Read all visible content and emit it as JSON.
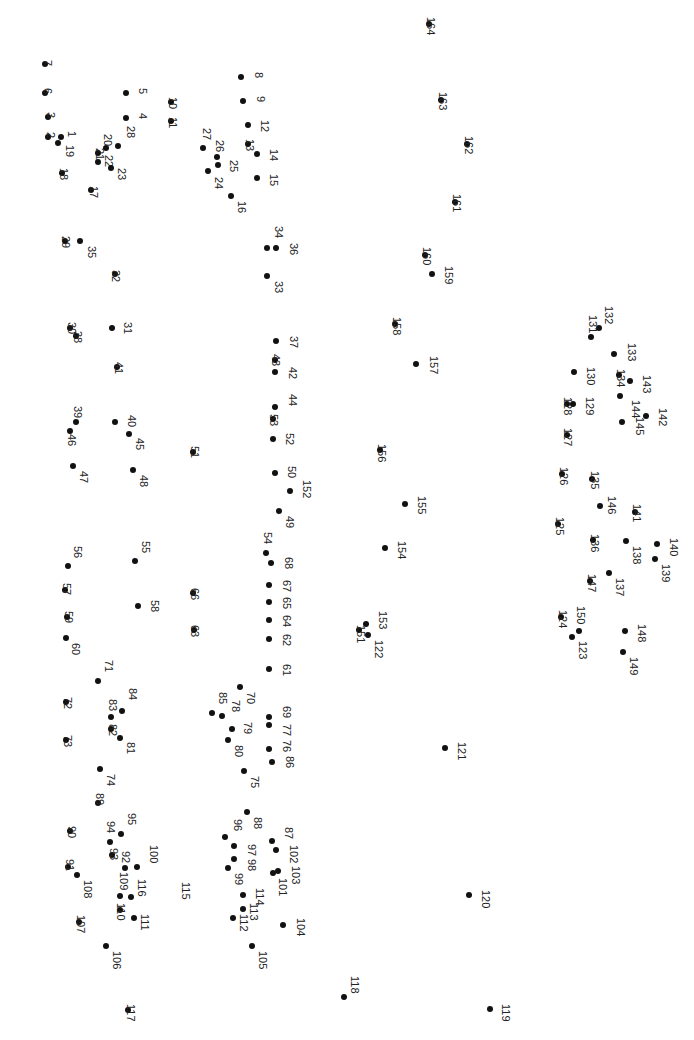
{
  "puzzle": {
    "type": "connect-the-dots",
    "orientation": "rotated-90",
    "dot_color": "#111111",
    "label_color": "#222222",
    "dots": [
      {
        "n": "1",
        "x": 61,
        "y": 137,
        "lx": 66,
        "ly": 131
      },
      {
        "n": "2",
        "x": 48,
        "y": 137,
        "lx": 45,
        "ly": 132
      },
      {
        "n": "3",
        "x": 48,
        "y": 117,
        "lx": 45,
        "ly": 112
      },
      {
        "n": "4",
        "x": 126,
        "y": 118,
        "lx": 137,
        "ly": 113
      },
      {
        "n": "5",
        "x": 126,
        "y": 93,
        "lx": 137,
        "ly": 88
      },
      {
        "n": "6",
        "x": 45,
        "y": 93,
        "lx": 42,
        "ly": 88
      },
      {
        "n": "7",
        "x": 45,
        "y": 64,
        "lx": 42,
        "ly": 60
      },
      {
        "n": "8",
        "x": 241,
        "y": 77,
        "lx": 253,
        "ly": 72
      },
      {
        "n": "9",
        "x": 243,
        "y": 101,
        "lx": 255,
        "ly": 96
      },
      {
        "n": "10",
        "x": 171,
        "y": 102,
        "lx": 167,
        "ly": 97
      },
      {
        "n": "11",
        "x": 171,
        "y": 121,
        "lx": 167,
        "ly": 117
      },
      {
        "n": "12",
        "x": 248,
        "y": 125,
        "lx": 259,
        "ly": 120
      },
      {
        "n": "13",
        "x": 248,
        "y": 144,
        "lx": 244,
        "ly": 139
      },
      {
        "n": "14",
        "x": 257,
        "y": 154,
        "lx": 268,
        "ly": 149
      },
      {
        "n": "15",
        "x": 257,
        "y": 178,
        "lx": 268,
        "ly": 174
      },
      {
        "n": "16",
        "x": 231,
        "y": 196,
        "lx": 236,
        "ly": 201
      },
      {
        "n": "17",
        "x": 91,
        "y": 190,
        "lx": 88,
        "ly": 186
      },
      {
        "n": "18",
        "x": 62,
        "y": 173,
        "lx": 58,
        "ly": 168
      },
      {
        "n": "19",
        "x": 58,
        "y": 143,
        "lx": 64,
        "ly": 145
      },
      {
        "n": "20",
        "x": 106,
        "y": 148,
        "lx": 102,
        "ly": 134
      },
      {
        "n": "21",
        "x": 98,
        "y": 153,
        "lx": 94,
        "ly": 148
      },
      {
        "n": "22",
        "x": 98,
        "y": 162,
        "lx": 103,
        "ly": 155
      },
      {
        "n": "23",
        "x": 111,
        "y": 168,
        "lx": 116,
        "ly": 168
      },
      {
        "n": "24",
        "x": 208,
        "y": 171,
        "lx": 213,
        "ly": 177
      },
      {
        "n": "25",
        "x": 218,
        "y": 165,
        "lx": 228,
        "ly": 160
      },
      {
        "n": "26",
        "x": 217,
        "y": 157,
        "lx": 214,
        "ly": 140
      },
      {
        "n": "27",
        "x": 203,
        "y": 148,
        "lx": 201,
        "ly": 128
      },
      {
        "n": "28",
        "x": 118,
        "y": 146,
        "lx": 125,
        "ly": 126
      },
      {
        "n": "29",
        "x": 65,
        "y": 241,
        "lx": 60,
        "ly": 236
      },
      {
        "n": "30",
        "x": 70,
        "y": 328,
        "lx": 66,
        "ly": 322
      },
      {
        "n": "31",
        "x": 112,
        "y": 328,
        "lx": 122,
        "ly": 322
      },
      {
        "n": "32",
        "x": 115,
        "y": 274,
        "lx": 110,
        "ly": 270
      },
      {
        "n": "33",
        "x": 267,
        "y": 276,
        "lx": 273,
        "ly": 281
      },
      {
        "n": "34",
        "x": 267,
        "y": 248,
        "lx": 273,
        "ly": 226
      },
      {
        "n": "35",
        "x": 80,
        "y": 241,
        "lx": 86,
        "ly": 246
      },
      {
        "n": "36",
        "x": 276,
        "y": 248,
        "lx": 288,
        "ly": 243
      },
      {
        "n": "37",
        "x": 276,
        "y": 341,
        "lx": 288,
        "ly": 336
      },
      {
        "n": "38",
        "x": 76,
        "y": 336,
        "lx": 72,
        "ly": 331
      },
      {
        "n": "39",
        "x": 76,
        "y": 422,
        "lx": 72,
        "ly": 406
      },
      {
        "n": "40",
        "x": 115,
        "y": 422,
        "lx": 126,
        "ly": 415
      },
      {
        "n": "41",
        "x": 117,
        "y": 367,
        "lx": 113,
        "ly": 362
      },
      {
        "n": "42",
        "x": 275,
        "y": 372,
        "lx": 287,
        "ly": 367
      },
      {
        "n": "43",
        "x": 275,
        "y": 360,
        "lx": 270,
        "ly": 354
      },
      {
        "n": "44",
        "x": 275,
        "y": 407,
        "lx": 287,
        "ly": 394
      },
      {
        "n": "45",
        "x": 129,
        "y": 434,
        "lx": 134,
        "ly": 438
      },
      {
        "n": "46",
        "x": 70,
        "y": 431,
        "lx": 66,
        "ly": 434
      },
      {
        "n": "47",
        "x": 73,
        "y": 466,
        "lx": 78,
        "ly": 471
      },
      {
        "n": "48",
        "x": 133,
        "y": 470,
        "lx": 138,
        "ly": 475
      },
      {
        "n": "49",
        "x": 279,
        "y": 511,
        "lx": 284,
        "ly": 516
      },
      {
        "n": "50",
        "x": 275,
        "y": 473,
        "lx": 286,
        "ly": 466
      },
      {
        "n": "51",
        "x": 193,
        "y": 452,
        "lx": 189,
        "ly": 446
      },
      {
        "n": "52",
        "x": 273,
        "y": 439,
        "lx": 284,
        "ly": 433
      },
      {
        "n": "53",
        "x": 273,
        "y": 419,
        "lx": 268,
        "ly": 414
      },
      {
        "n": "54",
        "x": 266,
        "y": 553,
        "lx": 262,
        "ly": 532
      },
      {
        "n": "55",
        "x": 135,
        "y": 561,
        "lx": 140,
        "ly": 541
      },
      {
        "n": "56",
        "x": 68,
        "y": 566,
        "lx": 72,
        "ly": 546
      },
      {
        "n": "57",
        "x": 65,
        "y": 590,
        "lx": 61,
        "ly": 583
      },
      {
        "n": "58",
        "x": 138,
        "y": 606,
        "lx": 149,
        "ly": 600
      },
      {
        "n": "59",
        "x": 67,
        "y": 617,
        "lx": 63,
        "ly": 611
      },
      {
        "n": "60",
        "x": 66,
        "y": 638,
        "lx": 70,
        "ly": 643
      },
      {
        "n": "61",
        "x": 269,
        "y": 669,
        "lx": 281,
        "ly": 664
      },
      {
        "n": "62",
        "x": 269,
        "y": 639,
        "lx": 281,
        "ly": 634
      },
      {
        "n": "63",
        "x": 194,
        "y": 630,
        "lx": 189,
        "ly": 625
      },
      {
        "n": "64",
        "x": 269,
        "y": 620,
        "lx": 281,
        "ly": 615
      },
      {
        "n": "65",
        "x": 269,
        "y": 602,
        "lx": 281,
        "ly": 597
      },
      {
        "n": "66",
        "x": 193,
        "y": 593,
        "lx": 189,
        "ly": 588
      },
      {
        "n": "67",
        "x": 269,
        "y": 585,
        "lx": 281,
        "ly": 580
      },
      {
        "n": "68",
        "x": 271,
        "y": 563,
        "lx": 283,
        "ly": 557
      },
      {
        "n": "69",
        "x": 269,
        "y": 717,
        "lx": 281,
        "ly": 706
      },
      {
        "n": "70",
        "x": 240,
        "y": 687,
        "lx": 245,
        "ly": 692
      },
      {
        "n": "71",
        "x": 98,
        "y": 681,
        "lx": 103,
        "ly": 660
      },
      {
        "n": "72",
        "x": 66,
        "y": 702,
        "lx": 62,
        "ly": 697
      },
      {
        "n": "73",
        "x": 66,
        "y": 740,
        "lx": 62,
        "ly": 735
      },
      {
        "n": "74",
        "x": 100,
        "y": 769,
        "lx": 105,
        "ly": 774
      },
      {
        "n": "75",
        "x": 244,
        "y": 771,
        "lx": 249,
        "ly": 776
      },
      {
        "n": "76",
        "x": 269,
        "y": 749,
        "lx": 281,
        "ly": 740
      },
      {
        "n": "77",
        "x": 269,
        "y": 725,
        "lx": 281,
        "ly": 724
      },
      {
        "n": "78",
        "x": 222,
        "y": 716,
        "lx": 230,
        "ly": 700
      },
      {
        "n": "79",
        "x": 232,
        "y": 729,
        "lx": 242,
        "ly": 722
      },
      {
        "n": "80",
        "x": 228,
        "y": 740,
        "lx": 233,
        "ly": 745
      },
      {
        "n": "81",
        "x": 120,
        "y": 738,
        "lx": 125,
        "ly": 742
      },
      {
        "n": "82",
        "x": 111,
        "y": 729,
        "lx": 107,
        "ly": 724
      },
      {
        "n": "83",
        "x": 111,
        "y": 717,
        "lx": 107,
        "ly": 699
      },
      {
        "n": "84",
        "x": 122,
        "y": 711,
        "lx": 127,
        "ly": 688
      },
      {
        "n": "85",
        "x": 212,
        "y": 713,
        "lx": 217,
        "ly": 692
      },
      {
        "n": "86",
        "x": 272,
        "y": 762,
        "lx": 284,
        "ly": 756
      },
      {
        "n": "87",
        "x": 272,
        "y": 841,
        "lx": 283,
        "ly": 827
      },
      {
        "n": "88",
        "x": 247,
        "y": 812,
        "lx": 252,
        "ly": 817
      },
      {
        "n": "89",
        "x": 98,
        "y": 803,
        "lx": 94,
        "ly": 793
      },
      {
        "n": "90",
        "x": 70,
        "y": 831,
        "lx": 66,
        "ly": 826
      },
      {
        "n": "91",
        "x": 68,
        "y": 867,
        "lx": 64,
        "ly": 859
      },
      {
        "n": "92",
        "x": 125,
        "y": 868,
        "lx": 120,
        "ly": 851
      },
      {
        "n": "93",
        "x": 112,
        "y": 855,
        "lx": 108,
        "ly": 848
      },
      {
        "n": "94",
        "x": 110,
        "y": 842,
        "lx": 105,
        "ly": 821
      },
      {
        "n": "95",
        "x": 121,
        "y": 834,
        "lx": 126,
        "ly": 813
      },
      {
        "n": "96",
        "x": 225,
        "y": 837,
        "lx": 232,
        "ly": 819
      },
      {
        "n": "97",
        "x": 234,
        "y": 846,
        "lx": 246,
        "ly": 844
      },
      {
        "n": "98",
        "x": 234,
        "y": 859,
        "lx": 246,
        "ly": 859
      },
      {
        "n": "99",
        "x": 228,
        "y": 868,
        "lx": 233,
        "ly": 873
      },
      {
        "n": "100",
        "x": 137,
        "y": 867,
        "lx": 148,
        "ly": 845
      },
      {
        "n": "101",
        "x": 273,
        "y": 873,
        "lx": 277,
        "ly": 878
      },
      {
        "n": "102",
        "x": 276,
        "y": 850,
        "lx": 288,
        "ly": 845
      },
      {
        "n": "103",
        "x": 278,
        "y": 871,
        "lx": 290,
        "ly": 866
      },
      {
        "n": "104",
        "x": 283,
        "y": 925,
        "lx": 295,
        "ly": 918
      },
      {
        "n": "105",
        "x": 252,
        "y": 946,
        "lx": 257,
        "ly": 951
      },
      {
        "n": "106",
        "x": 106,
        "y": 946,
        "lx": 111,
        "ly": 951
      },
      {
        "n": "107",
        "x": 79,
        "y": 922,
        "lx": 75,
        "ly": 915
      },
      {
        "n": "108",
        "x": 77,
        "y": 875,
        "lx": 82,
        "ly": 880
      },
      {
        "n": "109",
        "x": 120,
        "y": 896,
        "lx": 118,
        "ly": 872
      },
      {
        "n": "110",
        "x": 120,
        "y": 910,
        "lx": 115,
        "ly": 903
      },
      {
        "n": "111",
        "x": 134,
        "y": 918,
        "lx": 139,
        "ly": 914
      },
      {
        "n": "112",
        "x": 233,
        "y": 918,
        "lx": 238,
        "ly": 914
      },
      {
        "n": "113",
        "x": 243,
        "y": 909,
        "lx": 248,
        "ly": 903
      },
      {
        "n": "114",
        "x": 243,
        "y": 895,
        "lx": 254,
        "ly": 888
      },
      {
        "n": "115",
        "x": null,
        "y": null,
        "lx": 180,
        "ly": 882
      },
      {
        "n": "116",
        "x": 131,
        "y": 897,
        "lx": 136,
        "ly": 879
      },
      {
        "n": "117",
        "x": 128,
        "y": 1010,
        "lx": 125,
        "ly": 1004
      },
      {
        "n": "118",
        "x": 344,
        "y": 997,
        "lx": 349,
        "ly": 976
      },
      {
        "n": "119",
        "x": 490,
        "y": 1009,
        "lx": 500,
        "ly": 1004
      },
      {
        "n": "120",
        "x": 469,
        "y": 895,
        "lx": 480,
        "ly": 890
      },
      {
        "n": "121",
        "x": 445,
        "y": 748,
        "lx": 456,
        "ly": 742
      },
      {
        "n": "122",
        "x": 368,
        "y": 635,
        "lx": 373,
        "ly": 640
      },
      {
        "n": "123",
        "x": 572,
        "y": 637,
        "lx": 577,
        "ly": 641
      },
      {
        "n": "124",
        "x": 561,
        "y": 617,
        "lx": 557,
        "ly": 610
      },
      {
        "n": "125",
        "x": 558,
        "y": 524,
        "lx": 554,
        "ly": 517
      },
      {
        "n": "126",
        "x": 562,
        "y": 474,
        "lx": 558,
        "ly": 467
      },
      {
        "n": "127",
        "x": 567,
        "y": 435,
        "lx": 562,
        "ly": 428
      },
      {
        "n": "128",
        "x": 567,
        "y": 404,
        "lx": 562,
        "ly": 397
      },
      {
        "n": "129",
        "x": 573,
        "y": 404,
        "lx": 584,
        "ly": 397
      },
      {
        "n": "130",
        "x": 574,
        "y": 372,
        "lx": 585,
        "ly": 367
      },
      {
        "n": "131",
        "x": 591,
        "y": 337,
        "lx": 587,
        "ly": 315
      },
      {
        "n": "132",
        "x": 599,
        "y": 328,
        "lx": 603,
        "ly": 306
      },
      {
        "n": "133",
        "x": 614,
        "y": 354,
        "lx": 626,
        "ly": 343
      },
      {
        "n": "134",
        "x": 619,
        "y": 375,
        "lx": 615,
        "ly": 369
      },
      {
        "n": "135",
        "x": 592,
        "y": 479,
        "lx": 589,
        "ly": 471
      },
      {
        "n": "136",
        "x": 593,
        "y": 540,
        "lx": 589,
        "ly": 534
      },
      {
        "n": "137",
        "x": 609,
        "y": 573,
        "lx": 614,
        "ly": 578
      },
      {
        "n": "138",
        "x": 626,
        "y": 541,
        "lx": 631,
        "ly": 546
      },
      {
        "n": "139",
        "x": 655,
        "y": 559,
        "lx": 660,
        "ly": 564
      },
      {
        "n": "140",
        "x": 657,
        "y": 544,
        "lx": 668,
        "ly": 538
      },
      {
        "n": "141",
        "x": 635,
        "y": 512,
        "lx": 631,
        "ly": 504
      },
      {
        "n": "142",
        "x": 646,
        "y": 416,
        "lx": 657,
        "ly": 408
      },
      {
        "n": "143",
        "x": 630,
        "y": 381,
        "lx": 641,
        "ly": 375
      },
      {
        "n": "144",
        "x": 620,
        "y": 396,
        "lx": 630,
        "ly": 400
      },
      {
        "n": "145",
        "x": 622,
        "y": 422,
        "lx": 634,
        "ly": 417
      },
      {
        "n": "146",
        "x": 600,
        "y": 506,
        "lx": 606,
        "ly": 496
      },
      {
        "n": "147",
        "x": 590,
        "y": 581,
        "lx": 586,
        "ly": 574
      },
      {
        "n": "148",
        "x": 625,
        "y": 631,
        "lx": 636,
        "ly": 624
      },
      {
        "n": "149",
        "x": 623,
        "y": 652,
        "lx": 628,
        "ly": 657
      },
      {
        "n": "150",
        "x": 579,
        "y": 631,
        "lx": 575,
        "ly": 606
      },
      {
        "n": "151",
        "x": 359,
        "y": 630,
        "lx": 355,
        "ly": 625
      },
      {
        "n": "152",
        "x": 290,
        "y": 491,
        "lx": 301,
        "ly": 480
      },
      {
        "n": "153",
        "x": 366,
        "y": 624,
        "lx": 377,
        "ly": 611
      },
      {
        "n": "154",
        "x": 385,
        "y": 548,
        "lx": 396,
        "ly": 541
      },
      {
        "n": "155",
        "x": 405,
        "y": 504,
        "lx": 416,
        "ly": 496
      },
      {
        "n": "156",
        "x": 380,
        "y": 450,
        "lx": 376,
        "ly": 444
      },
      {
        "n": "157",
        "x": 416,
        "y": 364,
        "lx": 428,
        "ly": 356
      },
      {
        "n": "158",
        "x": 395,
        "y": 324,
        "lx": 391,
        "ly": 317
      },
      {
        "n": "159",
        "x": 432,
        "y": 274,
        "lx": 443,
        "ly": 266
      },
      {
        "n": "160",
        "x": 425,
        "y": 255,
        "lx": 421,
        "ly": 247
      },
      {
        "n": "161",
        "x": 455,
        "y": 202,
        "lx": 451,
        "ly": 194
      },
      {
        "n": "162",
        "x": 467,
        "y": 144,
        "lx": 463,
        "ly": 136
      },
      {
        "n": "163",
        "x": 441,
        "y": 100,
        "lx": 437,
        "ly": 92
      },
      {
        "n": "164",
        "x": 429,
        "y": 24,
        "lx": 425,
        "ly": 17
      }
    ]
  }
}
